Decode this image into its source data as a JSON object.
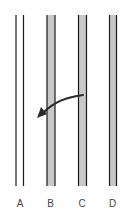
{
  "diagram": {
    "colors": {
      "line": "#1a1a1a",
      "fill": "#c8c8c8",
      "arrow": "#2a2a2a",
      "label": "#444444"
    },
    "channels": [
      {
        "label": "A",
        "shaded": false
      },
      {
        "label": "B",
        "shaded": true
      },
      {
        "label": "C",
        "shaded": true
      },
      {
        "label": "D",
        "shaded": true
      }
    ],
    "arrow": {
      "from": "C",
      "to": "A-B gap",
      "direction": "left"
    }
  }
}
